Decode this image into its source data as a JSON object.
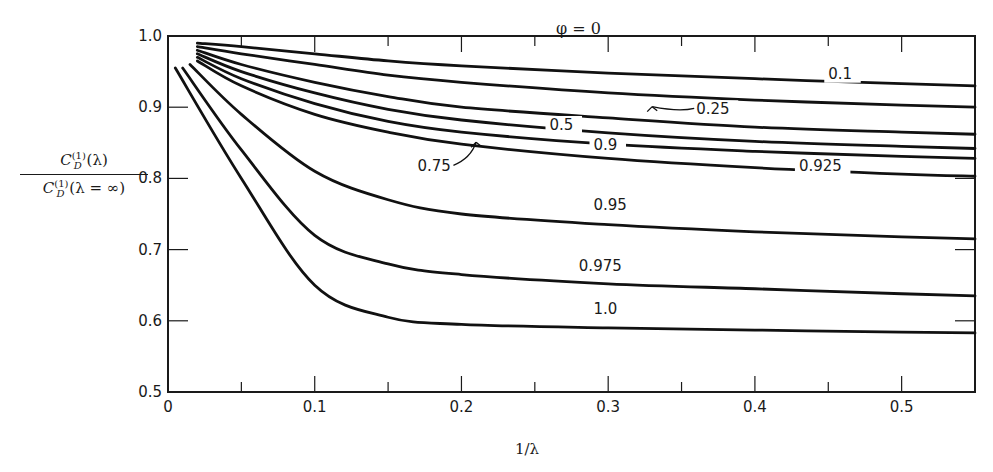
{
  "chart_data": {
    "type": "line",
    "title": "φ = 0",
    "xlabel": "1/λ",
    "ylabel": "C_D^(1)(λ) / C_D^(1)(λ = ∞)",
    "ylabel_numerator": "C_D^(1) (λ)",
    "ylabel_denominator": "C_D^(1) (λ = ∞)",
    "xlim": [
      0,
      0.55
    ],
    "ylim": [
      0.5,
      1.0
    ],
    "xticks": [
      "0",
      "0.1",
      "0.2",
      "0.3",
      "0.4",
      "0.5"
    ],
    "yticks": [
      "0.5",
      "0.6",
      "0.7",
      "0.8",
      "0.9",
      "1.0"
    ],
    "grid": false,
    "legend": "inline curve labels",
    "x": [
      0.02,
      0.05,
      0.1,
      0.15,
      0.2,
      0.3,
      0.4,
      0.5,
      0.55
    ],
    "series": [
      {
        "name": "0.1",
        "x_start": 0.02,
        "values": [
          0.99,
          0.985,
          0.975,
          0.965,
          0.958,
          0.948,
          0.94,
          0.933,
          0.93
        ]
      },
      {
        "name": "0.25",
        "x_start": 0.02,
        "values": [
          0.985,
          0.975,
          0.96,
          0.945,
          0.935,
          0.92,
          0.91,
          0.903,
          0.9
        ]
      },
      {
        "name": "0.5",
        "x_start": 0.02,
        "values": [
          0.98,
          0.96,
          0.935,
          0.915,
          0.9,
          0.885,
          0.872,
          0.865,
          0.862
        ]
      },
      {
        "name": "0.75",
        "x_start": 0.02,
        "values": [
          0.975,
          0.95,
          0.92,
          0.897,
          0.882,
          0.864,
          0.852,
          0.845,
          0.842
        ]
      },
      {
        "name": "0.9",
        "x_start": 0.02,
        "values": [
          0.97,
          0.94,
          0.905,
          0.88,
          0.865,
          0.848,
          0.838,
          0.831,
          0.828
        ]
      },
      {
        "name": "0.925",
        "x_start": 0.02,
        "values": [
          0.965,
          0.93,
          0.89,
          0.865,
          0.848,
          0.828,
          0.815,
          0.806,
          0.803
        ]
      },
      {
        "name": "0.95",
        "x_start": 0.015,
        "values": [
          0.96,
          0.89,
          0.81,
          0.77,
          0.75,
          0.735,
          0.725,
          0.718,
          0.715
        ]
      },
      {
        "name": "0.975",
        "x_start": 0.01,
        "values": [
          0.955,
          0.84,
          0.72,
          0.68,
          0.665,
          0.652,
          0.645,
          0.638,
          0.635
        ]
      },
      {
        "name": "1.0",
        "x_start": 0.005,
        "values": [
          0.955,
          0.8,
          0.65,
          0.605,
          0.595,
          0.59,
          0.587,
          0.584,
          0.583
        ]
      }
    ],
    "annotations": [
      {
        "text": "0.1",
        "at": [
          0.45,
          0.94
        ]
      },
      {
        "text": "0.25",
        "at": [
          0.36,
          0.89
        ],
        "arrow_to": [
          0.33,
          0.905
        ]
      },
      {
        "text": "0.5",
        "at": [
          0.26,
          0.868
        ]
      },
      {
        "text": "0.75",
        "at": [
          0.17,
          0.81
        ],
        "arrow_to": [
          0.21,
          0.855
        ]
      },
      {
        "text": "0.9",
        "at": [
          0.29,
          0.84
        ]
      },
      {
        "text": "0.925",
        "at": [
          0.43,
          0.81
        ]
      },
      {
        "text": "0.95",
        "at": [
          0.29,
          0.755
        ]
      },
      {
        "text": "0.975",
        "at": [
          0.28,
          0.67
        ]
      },
      {
        "text": "1.0",
        "at": [
          0.29,
          0.61
        ]
      }
    ]
  },
  "labels": {
    "title": "φ = 0",
    "xlabel": "1/λ",
    "ylabel_numerator": "C",
    "ylabel_numerator_sup": "(1)",
    "ylabel_numerator_sub": "D",
    "ylabel_numerator_arg": " (λ)",
    "ylabel_denominator": "C",
    "ylabel_denominator_sup": "(1)",
    "ylabel_denominator_sub": "D",
    "ylabel_denominator_arg": " (λ = ∞)"
  }
}
